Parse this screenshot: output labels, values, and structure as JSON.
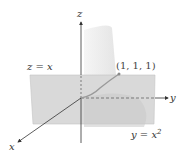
{
  "figure": {
    "axes": {
      "x_label": "x",
      "y_label": "y",
      "z_label": "z"
    },
    "surfaces": {
      "plane_label": "z = x",
      "cylinder_label_base": "y = x",
      "cylinder_label_exp": "2"
    },
    "point": {
      "label": "(1, 1, 1)",
      "x": 1,
      "y": 1,
      "z": 1
    },
    "colors": {
      "plane": "#d6d6d6",
      "cylinder": "#e8e8e8",
      "curve": "#9a9a9a",
      "axis": "#333333"
    }
  }
}
